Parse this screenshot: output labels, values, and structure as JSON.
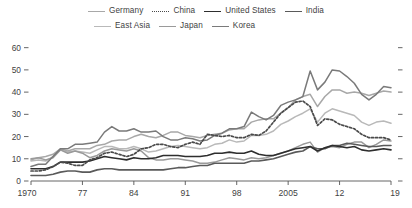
{
  "chart_data": {
    "type": "line",
    "title": "",
    "xlabel": "",
    "ylabel": "",
    "xlim": [
      1970,
      2019
    ],
    "ylim": [
      0,
      63
    ],
    "grid": false,
    "legend_position": "top",
    "y_ticks": [
      "0",
      "10",
      "20",
      "30",
      "40",
      "50",
      "60"
    ],
    "y_tick_values": [
      0,
      10,
      20,
      30,
      40,
      50,
      60
    ],
    "x_ticks": [
      "1970",
      "77",
      "84",
      "91",
      "98",
      "2005",
      "12",
      "19"
    ],
    "x_tick_values": [
      1970,
      1977,
      1984,
      1991,
      1998,
      2005,
      2012,
      2019
    ],
    "x": [
      1970,
      1971,
      1972,
      1973,
      1974,
      1975,
      1976,
      1977,
      1978,
      1979,
      1980,
      1981,
      1982,
      1983,
      1984,
      1985,
      1986,
      1987,
      1988,
      1989,
      1990,
      1991,
      1992,
      1993,
      1994,
      1995,
      1996,
      1997,
      1998,
      1999,
      2000,
      2001,
      2002,
      2003,
      2004,
      2005,
      2006,
      2007,
      2008,
      2009,
      2010,
      2011,
      2012,
      2013,
      2014,
      2015,
      2016,
      2017,
      2018,
      2019
    ],
    "series": [
      {
        "name": "Germany",
        "color": "#a8a8a8",
        "style": "solid",
        "width": 1.5,
        "values": [
          9.5,
          10.5,
          11.0,
          12.0,
          14.5,
          13.5,
          14.5,
          14.5,
          14.5,
          16.0,
          16.5,
          18.0,
          18.5,
          18.5,
          20.0,
          21.0,
          20.0,
          19.5,
          20.5,
          22.0,
          22.0,
          20.5,
          20.0,
          19.5,
          20.5,
          21.0,
          21.5,
          23.0,
          23.5,
          23.5,
          26.5,
          27.5,
          28.0,
          28.0,
          30.5,
          33.0,
          36.5,
          38.0,
          39.0,
          33.5,
          38.0,
          41.0,
          41.0,
          39.5,
          40.0,
          39.5,
          38.5,
          39.5,
          40.5,
          40.0
        ]
      },
      {
        "name": "East Asia",
        "color": "#b9b9b9",
        "style": "solid",
        "width": 1.5,
        "values": [
          9.0,
          9.5,
          9.0,
          11.0,
          14.0,
          13.0,
          13.5,
          13.0,
          12.5,
          14.0,
          15.5,
          15.5,
          14.5,
          14.5,
          15.5,
          14.5,
          13.0,
          13.5,
          14.5,
          15.5,
          16.0,
          15.5,
          15.0,
          14.5,
          15.0,
          16.5,
          17.0,
          18.5,
          17.5,
          18.0,
          20.5,
          20.5,
          21.0,
          22.5,
          25.5,
          27.0,
          29.0,
          30.5,
          32.5,
          26.5,
          30.5,
          32.5,
          31.5,
          30.5,
          29.5,
          26.5,
          25.0,
          26.5,
          27.0,
          26.0
        ]
      },
      {
        "name": "China",
        "color": "#4a4a4a",
        "style": "dotted",
        "width": 1.7,
        "values": [
          4.5,
          4.5,
          5.0,
          6.5,
          8.5,
          8.0,
          7.0,
          7.0,
          9.5,
          10.5,
          12.5,
          13.0,
          12.0,
          11.0,
          12.0,
          14.5,
          15.0,
          16.5,
          16.5,
          15.5,
          15.0,
          16.5,
          17.5,
          16.5,
          21.0,
          20.5,
          20.0,
          20.5,
          19.5,
          19.5,
          21.0,
          20.5,
          22.5,
          26.5,
          30.5,
          33.0,
          35.5,
          36.0,
          33.5,
          25.0,
          28.0,
          27.5,
          25.5,
          24.5,
          23.5,
          21.0,
          19.5,
          19.5,
          19.5,
          18.5
        ]
      },
      {
        "name": "Japan",
        "color": "#9a9a9a",
        "style": "solid",
        "width": 1.5,
        "values": [
          10.0,
          10.5,
          9.5,
          10.5,
          14.0,
          12.5,
          13.5,
          12.5,
          10.5,
          11.5,
          13.5,
          14.5,
          14.0,
          13.5,
          14.5,
          13.5,
          10.5,
          9.5,
          9.5,
          10.0,
          10.0,
          9.5,
          9.0,
          8.0,
          8.0,
          8.5,
          9.5,
          10.5,
          10.0,
          9.5,
          10.5,
          10.0,
          10.5,
          11.5,
          12.5,
          13.5,
          15.0,
          16.5,
          17.5,
          13.0,
          15.0,
          15.5,
          15.0,
          16.5,
          17.5,
          17.5,
          15.0,
          16.5,
          18.5,
          18.0
        ]
      },
      {
        "name": "United States",
        "color": "#2e2e2e",
        "style": "solid",
        "width": 1.6,
        "values": [
          5.5,
          5.5,
          5.5,
          6.5,
          8.5,
          8.5,
          8.5,
          8.5,
          9.0,
          10.0,
          11.0,
          10.5,
          10.0,
          9.5,
          10.5,
          10.0,
          10.0,
          10.5,
          11.5,
          11.5,
          11.5,
          11.0,
          11.0,
          11.0,
          11.5,
          12.5,
          12.5,
          13.0,
          12.5,
          12.5,
          13.5,
          12.0,
          11.5,
          11.5,
          12.5,
          13.5,
          14.5,
          15.0,
          15.5,
          13.5,
          15.0,
          16.0,
          15.5,
          15.0,
          15.5,
          14.0,
          13.5,
          14.0,
          14.5,
          14.0
        ]
      },
      {
        "name": "Korea",
        "color": "#7a7a7a",
        "style": "solid",
        "width": 1.5,
        "values": [
          6.5,
          7.5,
          7.5,
          11.0,
          14.5,
          14.5,
          16.5,
          16.5,
          17.0,
          17.5,
          22.0,
          24.5,
          22.5,
          22.5,
          23.5,
          22.0,
          22.0,
          22.5,
          20.0,
          18.5,
          18.5,
          19.5,
          19.0,
          18.0,
          18.5,
          20.5,
          21.5,
          23.5,
          23.5,
          24.5,
          31.0,
          29.0,
          27.5,
          29.5,
          34.0,
          35.5,
          36.5,
          38.0,
          49.5,
          41.0,
          44.5,
          50.0,
          49.5,
          47.0,
          44.0,
          39.0,
          36.5,
          39.0,
          42.5,
          42.0
        ]
      },
      {
        "name": "India",
        "color": "#5a5a5a",
        "style": "solid",
        "width": 1.6,
        "values": [
          2.5,
          2.5,
          2.5,
          3.0,
          4.0,
          4.5,
          4.5,
          4.0,
          4.0,
          5.0,
          5.5,
          5.5,
          5.0,
          5.0,
          5.0,
          5.0,
          5.0,
          5.0,
          5.0,
          5.5,
          6.0,
          6.0,
          6.5,
          7.0,
          7.0,
          8.0,
          8.0,
          8.0,
          8.0,
          8.0,
          9.0,
          9.0,
          9.5,
          10.0,
          11.0,
          12.0,
          13.0,
          13.5,
          15.5,
          14.5,
          14.5,
          16.0,
          16.0,
          17.0,
          16.5,
          16.0,
          15.5,
          15.5,
          16.0,
          16.0
        ]
      }
    ],
    "legend": [
      {
        "label": "Germany",
        "color": "#a8a8a8",
        "style": "solid"
      },
      {
        "label": "China",
        "color": "#4a4a4a",
        "style": "dotted"
      },
      {
        "label": "United States",
        "color": "#2e2e2e",
        "style": "solid"
      },
      {
        "label": "India",
        "color": "#5a5a5a",
        "style": "solid"
      },
      {
        "label": "East Asia",
        "color": "#b9b9b9",
        "style": "solid"
      },
      {
        "label": "Japan",
        "color": "#9a9a9a",
        "style": "solid"
      },
      {
        "label": "Korea",
        "color": "#7a7a7a",
        "style": "solid"
      }
    ]
  },
  "axis": {
    "line_color": "#555555",
    "tick_color": "#555555",
    "label_color": "#3f3f3f"
  }
}
